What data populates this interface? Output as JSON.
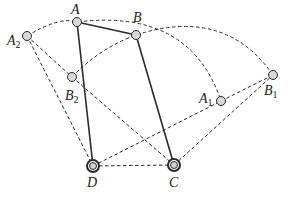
{
  "diagram": {
    "type": "four-bar linkage positions",
    "colors": {
      "line": "#2a2a2a",
      "joint_fill": "#d8d8d8",
      "background": "#ffffff"
    },
    "points": {
      "A": {
        "label": "A",
        "sub": "",
        "x": 77,
        "y": 22
      },
      "B": {
        "label": "B",
        "sub": "",
        "x": 136,
        "y": 35
      },
      "A2": {
        "label": "A",
        "sub": "2",
        "x": 27,
        "y": 36
      },
      "B2": {
        "label": "B",
        "sub": "2",
        "x": 72,
        "y": 77
      },
      "A1": {
        "label": "A",
        "sub": "1",
        "x": 221,
        "y": 101
      },
      "B1": {
        "label": "B",
        "sub": "1",
        "x": 273,
        "y": 75
      },
      "D": {
        "label": "D",
        "sub": "",
        "x": 93,
        "y": 166
      },
      "C": {
        "label": "C",
        "sub": "",
        "x": 174,
        "y": 165
      }
    },
    "solid_links": [
      [
        "A",
        "D"
      ],
      [
        "A",
        "B"
      ],
      [
        "B",
        "C"
      ]
    ],
    "dashed_links": [
      [
        "A2",
        "D"
      ],
      [
        "A2",
        "B2"
      ],
      [
        "B2",
        "C"
      ],
      [
        "D",
        "C"
      ],
      [
        "D",
        "A1"
      ],
      [
        "A1",
        "B1"
      ],
      [
        "C",
        "B1"
      ]
    ],
    "arcs": [
      {
        "center": "D",
        "from": "A2",
        "through": "A",
        "to": "A1"
      },
      {
        "center": "C",
        "from": "B2",
        "through": "B",
        "to": "B1"
      }
    ]
  }
}
